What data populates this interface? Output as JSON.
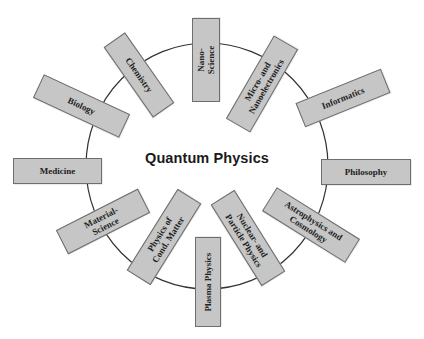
{
  "center": {
    "title": "Quantum Physics"
  },
  "colors": {
    "box_fill": "#c6c6c6",
    "box_border": "#6e6e6e",
    "ring": "#333333",
    "text": "#222222"
  },
  "topics": [
    {
      "id": "nano-science",
      "label": "Nano-\nScience"
    },
    {
      "id": "micro-nanoelectronics",
      "label": "Micro- and\nNanoelectronics"
    },
    {
      "id": "informatics",
      "label": "Informatics"
    },
    {
      "id": "philosophy",
      "label": "Philosophy"
    },
    {
      "id": "astrophysics-cosmology",
      "label": "Astrophysics and\nCosmology"
    },
    {
      "id": "nuclear-particle-physics",
      "label": "Nuclear- and\nParticle Physics"
    },
    {
      "id": "plasma-physics",
      "label": "Plasma Physics"
    },
    {
      "id": "physics-cond-matter",
      "label": "Physics of\nCond. Matter"
    },
    {
      "id": "material-science",
      "label": "Material-\nScience"
    },
    {
      "id": "medicine",
      "label": "Medicine"
    },
    {
      "id": "biology",
      "label": "Biology"
    },
    {
      "id": "chemistry",
      "label": "Chemistry"
    }
  ]
}
